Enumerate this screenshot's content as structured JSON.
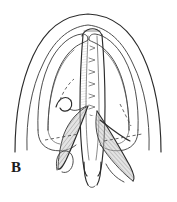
{
  "figure": {
    "panel_label": "B",
    "caption_text": "",
    "alt_description": "Line drawing of a coronal section through the larynx and upper trachea, showing the arched outer cartilage outline, paired lateral recesses, a central vertically striated airway column, and two shaded hatched triangular folds descending on either side of the midline.",
    "background_color": "#ffffff",
    "ink_color": "#2b2b2b",
    "shade_color": "#9a9a9a",
    "hatch_color": "#555555"
  },
  "geometry": {
    "canvas": {
      "width": 177,
      "height": 202
    },
    "outer_dome": {
      "name": "outer-cartilage-outline",
      "apex_y": 14,
      "left_x": 14,
      "right_x": 163,
      "base_y": 150
    },
    "inner_dome": {
      "name": "inner-cartilage-outline",
      "apex_y": 24,
      "left_x": 26,
      "right_x": 151
    },
    "left_recess": {
      "name": "left-lateral-recess",
      "top_y": 38,
      "bottom_y": 118
    },
    "right_recess": {
      "name": "right-lateral-recess",
      "top_y": 38,
      "bottom_y": 118
    },
    "central_column": {
      "name": "central-airway-column",
      "top_y": 30,
      "bottom_y": 170,
      "left_x": 80,
      "right_x": 104,
      "ring_count": 7
    },
    "left_fold": {
      "name": "left-shaded-fold",
      "apex_x": 88,
      "apex_y": 108,
      "tip_x": 63,
      "tip_y": 168
    },
    "right_fold": {
      "name": "right-shaded-fold",
      "apex_x": 96,
      "apex_y": 112,
      "tip_x": 132,
      "tip_y": 182
    },
    "dashed_guides": [
      {
        "name": "left-dashed-guide",
        "x1": 46,
        "y1": 139,
        "x2": 78,
        "y2": 134
      },
      {
        "name": "right-dashed-guide",
        "x1": 104,
        "y1": 140,
        "x2": 141,
        "y2": 134
      },
      {
        "name": "left-inner-dashed-guide",
        "x1": 60,
        "y1": 98,
        "x2": 74,
        "y2": 80
      }
    ]
  }
}
